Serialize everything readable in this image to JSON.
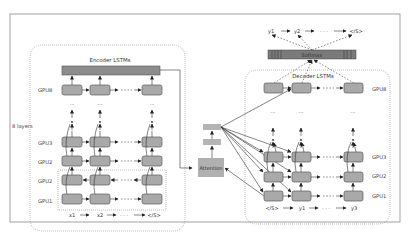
{
  "figure": {
    "encoder": {
      "title": "Encoder LSTMs",
      "layers_label": "8 layers",
      "gpu_labels": [
        "GPU8",
        "GPU3",
        "GPU2",
        "GPU2",
        "GPU1"
      ],
      "inputs": [
        "x1",
        "x2",
        "</S>"
      ],
      "ellipsis": "· · ·"
    },
    "attention": {
      "label": "Attention"
    },
    "decoder": {
      "title": "Decoder LSTMs",
      "gpu_labels": [
        "GPU8",
        "GPU3",
        "GPU2",
        "GPU1"
      ],
      "inputs": [
        "</S>",
        "y1",
        "y3"
      ],
      "ellipsis": "· · ·"
    },
    "softmax": {
      "label": "Softmax",
      "outputs": [
        "y1",
        "y2",
        "</S>"
      ]
    },
    "colors": {
      "cell_fill": "#a9a9a9",
      "bar_fill": "#8c8c8c",
      "attention_fill": "#b0b0b0",
      "frame": "#888888"
    }
  }
}
